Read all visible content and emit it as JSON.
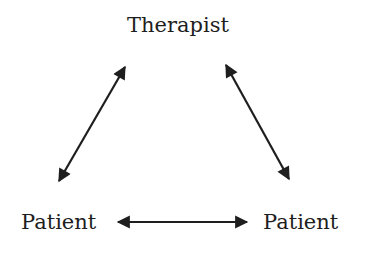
{
  "diagram": {
    "nodes": [
      {
        "id": "therapist",
        "label": "Therapist"
      },
      {
        "id": "patient_left",
        "label": "Patient"
      },
      {
        "id": "patient_right",
        "label": "Patient"
      }
    ],
    "edges": [
      {
        "from": "therapist",
        "to": "patient_left",
        "direction": "bidirectional"
      },
      {
        "from": "therapist",
        "to": "patient_right",
        "direction": "bidirectional"
      },
      {
        "from": "patient_left",
        "to": "patient_right",
        "direction": "bidirectional"
      }
    ],
    "colors": {
      "stroke": "#1e1e1e",
      "text": "#1e1e1e",
      "background": "#ffffff"
    }
  }
}
